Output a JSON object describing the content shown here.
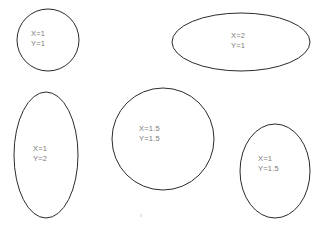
{
  "diagram": {
    "background_color": "#ffffff",
    "stroke_color": "#2b2b2b",
    "label_color": "#7a7a7a",
    "width": 319,
    "height": 229,
    "shapes": [
      {
        "id": "shape-top-left",
        "kind": "circle",
        "x_scale": "X=1",
        "y_scale": "Y=1",
        "cx": 48,
        "cy": 40,
        "rx": 31,
        "ry": 31,
        "label_x": 31,
        "label_y": 29
      },
      {
        "id": "shape-top-right",
        "kind": "ellipse-wide",
        "x_scale": "X=2",
        "y_scale": "Y=1",
        "cx": 241,
        "cy": 42,
        "rx": 69,
        "ry": 29,
        "label_x": 231,
        "label_y": 31
      },
      {
        "id": "shape-bottom-left",
        "kind": "ellipse-tall",
        "x_scale": "X=1",
        "y_scale": "Y=2",
        "cx": 46,
        "cy": 155,
        "rx": 32,
        "ry": 63,
        "label_x": 33,
        "label_y": 144
      },
      {
        "id": "shape-center",
        "kind": "circle",
        "x_scale": "X=1.5",
        "y_scale": "Y=1.5",
        "cx": 163,
        "cy": 139,
        "rx": 51,
        "ry": 51,
        "label_x": 139,
        "label_y": 124
      },
      {
        "id": "shape-bottom-right",
        "kind": "ellipse-tall",
        "x_scale": "X=1",
        "y_scale": "Y=1.5",
        "cx": 275,
        "cy": 171,
        "rx": 35,
        "ry": 47,
        "label_x": 258,
        "label_y": 154
      }
    ],
    "artifact": {
      "name": "stray-speck",
      "x": 140,
      "y": 214
    }
  }
}
